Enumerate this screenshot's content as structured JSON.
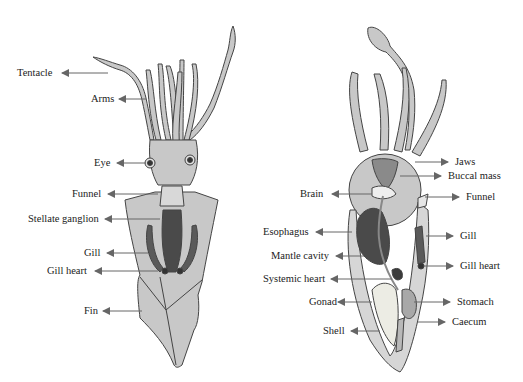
{
  "figure": {
    "left_diagram": {
      "name": "external-and-dorsal-squid-anatomy",
      "labels": [
        {
          "id": "tentacle",
          "text": "Tentacle",
          "x": 17,
          "y": 73,
          "arrow_to": [
            60,
            73
          ],
          "arrow_from": [
            108,
            73
          ]
        },
        {
          "id": "arms",
          "text": "Arms",
          "x": 91,
          "y": 99,
          "arrow_to": [
            118,
            99
          ],
          "arrow_from": [
            146,
            99
          ]
        },
        {
          "id": "eye",
          "text": "Eye",
          "x": 94,
          "y": 163,
          "arrow_to": [
            116,
            163
          ],
          "arrow_from": [
            146,
            163
          ]
        },
        {
          "id": "funnel",
          "text": "Funnel",
          "x": 72,
          "y": 194,
          "arrow_to": [
            106,
            194
          ],
          "arrow_from": [
            158,
            194
          ]
        },
        {
          "id": "stellate-ganglion",
          "text": "Stellate ganglion",
          "x": 28,
          "y": 219,
          "arrow_to": [
            104,
            219
          ],
          "arrow_from": [
            160,
            219
          ]
        },
        {
          "id": "gill",
          "text": "Gill",
          "x": 84,
          "y": 253,
          "arrow_to": [
            106,
            253
          ],
          "arrow_from": [
            148,
            253
          ]
        },
        {
          "id": "gill-heart",
          "text": "Gill heart",
          "x": 47,
          "y": 271,
          "arrow_to": [
            94,
            271
          ],
          "arrow_from": [
            158,
            271
          ]
        },
        {
          "id": "fin",
          "text": "Fin",
          "x": 84,
          "y": 311,
          "arrow_to": [
            102,
            311
          ],
          "arrow_from": [
            142,
            311
          ]
        }
      ]
    },
    "right_diagram": {
      "name": "internal-squid-anatomy-lateral",
      "labels": [
        {
          "id": "jaws",
          "text": "Jaws",
          "side": "right",
          "x": 455,
          "y": 162
        },
        {
          "id": "buccal-mass",
          "text": "Buccal mass",
          "side": "right",
          "x": 448,
          "y": 176
        },
        {
          "id": "funnel",
          "text": "Funnel",
          "side": "right",
          "x": 466,
          "y": 197
        },
        {
          "id": "gill",
          "text": "Gill",
          "side": "right",
          "x": 460,
          "y": 236
        },
        {
          "id": "gill-heart",
          "text": "Gill heart",
          "side": "right",
          "x": 460,
          "y": 266
        },
        {
          "id": "stomach",
          "text": "Stomach",
          "side": "right",
          "x": 457,
          "y": 302
        },
        {
          "id": "caecum",
          "text": "Caecum",
          "side": "right",
          "x": 452,
          "y": 322
        },
        {
          "id": "brain",
          "text": "Brain",
          "side": "left",
          "x": 300,
          "y": 194
        },
        {
          "id": "esophagus",
          "text": "Esophagus",
          "side": "left",
          "x": 263,
          "y": 232
        },
        {
          "id": "mantle-cavity",
          "text": "Mantle cavity",
          "side": "left",
          "x": 271,
          "y": 256
        },
        {
          "id": "systemic-heart",
          "text": "Systemic heart",
          "side": "left",
          "x": 263,
          "y": 279
        },
        {
          "id": "gonad",
          "text": "Gonad",
          "side": "left",
          "x": 309,
          "y": 302
        },
        {
          "id": "shell",
          "text": "Shell",
          "side": "left",
          "x": 323,
          "y": 331
        }
      ]
    },
    "colors": {
      "body_fill": "#c8c8c8",
      "outline": "#444444",
      "dark_organ": "#4a4a4a",
      "arrow": "#666666",
      "text": "#222222",
      "light_organ": "#e6e6e0"
    }
  }
}
